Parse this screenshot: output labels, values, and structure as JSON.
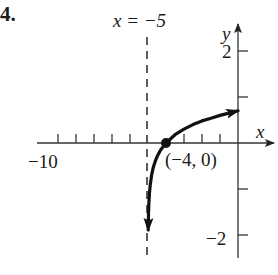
{
  "problem_number": "4.",
  "asymptote_label": "x = −5",
  "axis_labels": {
    "x": "x",
    "y": "y"
  },
  "tick_labels": {
    "x_min": "−10",
    "y_top": "2",
    "y_bottom": "−2"
  },
  "point_label": "(−4, 0)",
  "colors": {
    "ink": "#1a1a1a",
    "axis": "#333333",
    "background": "#ffffff"
  },
  "chart_data": {
    "type": "line",
    "title": "",
    "function": "y = log(x + 5)",
    "xlabel": "x",
    "ylabel": "y",
    "xlim": [
      -11,
      2
    ],
    "ylim": [
      -2.4,
      2.6
    ],
    "grid": false,
    "legend": null,
    "x_ticks": [
      -10,
      -9,
      -8,
      -7,
      -6,
      -5,
      -4,
      -3,
      -2,
      -1
    ],
    "y_ticks": [
      -2,
      -1,
      1,
      2
    ],
    "labeled_x_ticks": [
      {
        "value": -10,
        "label": "−10"
      }
    ],
    "labeled_y_ticks": [
      {
        "value": 2,
        "label": "2"
      },
      {
        "value": -2,
        "label": "−2"
      }
    ],
    "asymptote": {
      "type": "vertical",
      "x": -5,
      "label": "x = −5",
      "style": "dashed"
    },
    "highlighted_points": [
      {
        "x": -4,
        "y": 0,
        "label": "(−4, 0)"
      }
    ],
    "series": [
      {
        "name": "y = log(x + 5)",
        "x": [
          -4.987,
          -4.98,
          -4.97,
          -4.95,
          -4.92,
          -4.88,
          -4.8,
          -4.7,
          -4.6,
          -4.5,
          -4.3,
          -4.0,
          -3.5,
          -3.0,
          -2.5,
          -2.0,
          -1.5,
          -1.0,
          -0.5,
          0.0
        ],
        "y": [
          -1.89,
          -1.7,
          -1.52,
          -1.3,
          -1.1,
          -0.92,
          -0.7,
          -0.52,
          -0.4,
          -0.3,
          -0.15,
          0.0,
          0.18,
          0.3,
          0.4,
          0.48,
          0.54,
          0.6,
          0.65,
          0.7
        ],
        "arrow_ends": true
      }
    ]
  },
  "layout": {
    "origin_px": [
      238,
      143
    ],
    "x_unit_px": 18,
    "y_unit_px": 46
  }
}
